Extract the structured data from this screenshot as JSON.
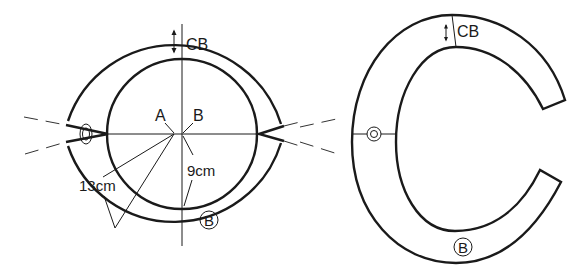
{
  "figures": [
    {
      "name": "full-circle-pattern",
      "labels": {
        "cb": "CB",
        "point_a": "A",
        "point_b": "B",
        "inner_radius": "9cm",
        "outer_radius": "13cm",
        "pattern_mark": "B"
      },
      "measurements": {
        "inner_radius_cm": 9,
        "outer_radius_cm": 13
      }
    },
    {
      "name": "c-shape-pattern",
      "labels": {
        "cb": "CB",
        "pattern_mark": "B"
      }
    }
  ],
  "colors": {
    "line": "#1a1a1a",
    "background": "#ffffff"
  }
}
